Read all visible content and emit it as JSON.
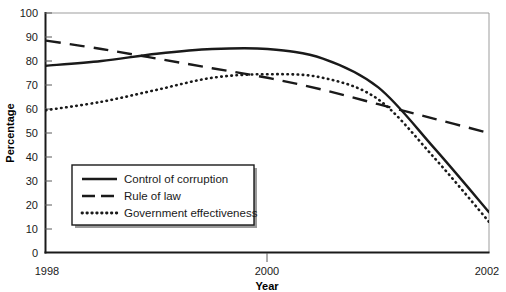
{
  "chart_data": {
    "type": "line",
    "title": "",
    "xlabel": "Year",
    "ylabel": "Percentage",
    "xlim": [
      1998,
      2002
    ],
    "ylim": [
      0,
      100
    ],
    "grid": false,
    "legend_position": "lower-left-inside",
    "x_tick_labels": [
      "1998",
      "2000",
      "2002"
    ],
    "x_tick_values": [
      1998,
      2000,
      2002
    ],
    "y_tick_labels": [
      "0",
      "10",
      "20",
      "30",
      "40",
      "50",
      "60",
      "70",
      "80",
      "90",
      "100"
    ],
    "y_tick_values": [
      0,
      10,
      20,
      30,
      40,
      50,
      60,
      70,
      80,
      90,
      100
    ],
    "x": [
      1998,
      1998.5,
      1999,
      1999.5,
      2000,
      2000.5,
      2001,
      2001.5,
      2002
    ],
    "series": [
      {
        "name": "Control of corruption",
        "style": "solid",
        "color": "#1a1a1a",
        "values": [
          78,
          80,
          83,
          85,
          85,
          81,
          69,
          44,
          17
        ]
      },
      {
        "name": "Rule of law",
        "style": "dashed",
        "color": "#1a1a1a",
        "values": [
          88.5,
          85,
          81,
          77,
          73,
          68,
          62,
          56,
          50
        ]
      },
      {
        "name": "Government effectiveness",
        "style": "dotted",
        "color": "#1a1a1a",
        "values": [
          59.5,
          63,
          68,
          73,
          74.5,
          73,
          64,
          40,
          13
        ]
      }
    ]
  },
  "axes": {
    "y_label": "Percentage",
    "x_label": "Year",
    "y_ticks": [
      "100",
      "90",
      "80",
      "70",
      "60",
      "50",
      "40",
      "30",
      "20",
      "10",
      "0"
    ],
    "x_ticks": [
      "1998",
      "2000",
      "2002"
    ]
  },
  "legend": {
    "items": [
      {
        "label": "Control of corruption",
        "style": "solid"
      },
      {
        "label": "Rule of law",
        "style": "dashed"
      },
      {
        "label": "Government effectiveness",
        "style": "dotted"
      }
    ]
  },
  "colors": {
    "line": "#1a1a1a",
    "frame": "#8f8f8f",
    "axis": "#1a1a1a",
    "legend_border": "#1a1a1a",
    "legend_shadow": "#9a9a9a",
    "background": "#ffffff"
  }
}
